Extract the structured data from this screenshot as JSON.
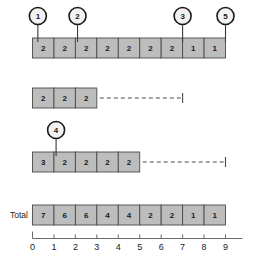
{
  "chart_data": {
    "type": "bar",
    "title": "",
    "subtitle": "",
    "xlabel": "",
    "ylabel": "",
    "orientation": "horizontal",
    "stacked": true,
    "grid": false,
    "legend": "none",
    "xlim": [
      0,
      9
    ],
    "xticks": [
      0,
      1,
      2,
      3,
      4,
      5,
      6,
      7,
      8,
      9
    ],
    "xtick_labels": [
      "0",
      "1",
      "2",
      "3",
      "4",
      "5",
      "6",
      "7",
      "8",
      "9"
    ],
    "categories": [
      "",
      "",
      "",
      "Total"
    ],
    "ytick_labels": [
      "",
      "",
      "",
      "Total"
    ],
    "series": [
      {
        "name": "row-1",
        "row_label": "",
        "segment_values": [
          2,
          2,
          2,
          2,
          2,
          2,
          2,
          1,
          1
        ],
        "segment_count": 9,
        "bar_end": 9,
        "dashed_extension": false,
        "dashed_end": null
      },
      {
        "name": "row-2",
        "row_label": "",
        "segment_values": [
          2,
          2,
          2
        ],
        "segment_count": 3,
        "bar_end": 3,
        "dashed_extension": true,
        "dashed_end": 7
      },
      {
        "name": "row-3",
        "row_label": "",
        "segment_values": [
          3,
          2,
          2,
          2,
          2
        ],
        "segment_count": 5,
        "bar_end": 5,
        "dashed_extension": true,
        "dashed_end": 9
      },
      {
        "name": "row-total",
        "row_label": "Total",
        "segment_values": [
          7,
          6,
          6,
          4,
          4,
          2,
          2,
          1,
          1
        ],
        "segment_count": 9,
        "bar_end": 9,
        "dashed_extension": false,
        "dashed_end": null
      }
    ],
    "colors": {
      "segment_fill": "#bdbdbd",
      "segment_stroke": "#4a4a4a",
      "axis": "#6b6b6b",
      "text": "#1a1a1a",
      "callout_fill": "#f2f2f2",
      "callout_stroke": "#1a1a1a",
      "dashed": "#4a4a4a",
      "background": "#ffffff"
    },
    "callouts": [
      {
        "label": "1",
        "x_value": 0.25,
        "target_row": 0
      },
      {
        "label": "2",
        "x_value": 2.1,
        "target_row": 0
      },
      {
        "label": "3",
        "x_value": 7.0,
        "target_row": 0
      },
      {
        "label": "5",
        "x_value": 9.0,
        "target_row": 0
      },
      {
        "label": "4",
        "x_value": 1.1,
        "target_row": 2
      }
    ]
  }
}
